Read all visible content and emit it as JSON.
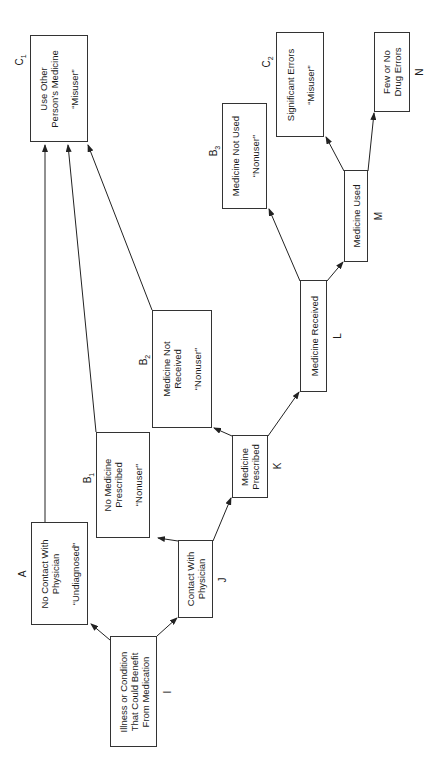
{
  "diagram": {
    "orientation": "rotated-90-ccw",
    "nodes": {
      "I": {
        "label": "I",
        "lines": [
          "Illness or Condition",
          "That Could Benefit",
          "From Medication"
        ],
        "category": ""
      },
      "A": {
        "label": "A",
        "lines": [
          "No Contact With",
          "Physician"
        ],
        "category": "“Undiagnosed”"
      },
      "J": {
        "label": "J",
        "lines": [
          "Contact With",
          "Physician"
        ],
        "category": ""
      },
      "B1": {
        "label": "B",
        "sub": "1",
        "lines": [
          "No Medicine",
          "Prescribed"
        ],
        "category": "“Nonuser”"
      },
      "K": {
        "label": "K",
        "lines": [
          "Medicine",
          "Prescribed"
        ],
        "category": ""
      },
      "B2": {
        "label": "B",
        "sub": "2",
        "lines": [
          "Medicine Not",
          "Received"
        ],
        "category": "“Nonuser”"
      },
      "L": {
        "label": "L",
        "lines": [
          "Medicine Received"
        ],
        "category": ""
      },
      "B3": {
        "label": "B",
        "sub": "3",
        "lines": [
          "Medicine Not Used"
        ],
        "category": "“Nonuser”"
      },
      "M": {
        "label": "M",
        "lines": [
          "Medicine Used"
        ],
        "category": ""
      },
      "C1": {
        "label": "C",
        "sub": "1",
        "lines": [
          "Use Other",
          "Person’s Medicine"
        ],
        "category": "“Misuser”"
      },
      "C2": {
        "label": "C",
        "sub": "2",
        "lines": [
          "Significant Errors"
        ],
        "category": "“Misuser”"
      },
      "N": {
        "label": "N",
        "lines": [
          "Few or No",
          "Drug Errors"
        ],
        "category": ""
      }
    },
    "edges": [
      [
        "I",
        "A"
      ],
      [
        "I",
        "J"
      ],
      [
        "J",
        "B1"
      ],
      [
        "J",
        "K"
      ],
      [
        "K",
        "B2"
      ],
      [
        "K",
        "L"
      ],
      [
        "L",
        "B3"
      ],
      [
        "L",
        "M"
      ],
      [
        "M",
        "C2"
      ],
      [
        "M",
        "N"
      ],
      [
        "A",
        "C1"
      ],
      [
        "B1",
        "C1"
      ],
      [
        "B2",
        "C1"
      ]
    ]
  }
}
